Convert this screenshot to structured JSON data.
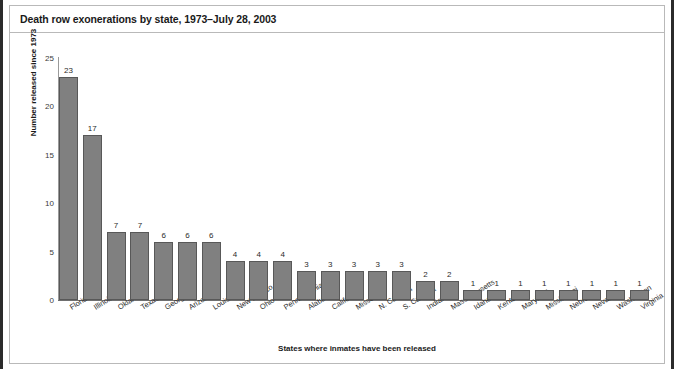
{
  "figure": {
    "title": "Death row exonerations by state, 1973–July 28, 2003",
    "bar_color": "#808080",
    "bar_edge_color": "#585858",
    "axis_color": "#6f6f6f",
    "background": "#ffffff"
  },
  "chart_data": {
    "type": "bar",
    "title": "Death row exonerations by state, 1973–July 28, 2003",
    "xlabel": "States where inmates have been released",
    "ylabel": "Number released since 1973",
    "ylim": [
      0,
      25
    ],
    "yticks": [
      0,
      5,
      10,
      15,
      20,
      25
    ],
    "ytick_labels": [
      "0",
      "5",
      "10",
      "15",
      "20",
      "25"
    ],
    "grid": false,
    "legend": null,
    "categories": [
      "Florida",
      "Illinois",
      "Oklahoma",
      "Texas",
      "Georgia",
      "Arizona",
      "Louisiana",
      "New Mexico",
      "Ohio",
      "Pennsylvania",
      "Alabama",
      "California",
      "Missouri",
      "N. Carolina",
      "S. Carolina",
      "Indiana",
      "Massachusetts",
      "Idaho",
      "Kentucky",
      "Maryland",
      "Mississippi",
      "Nebraska",
      "Nevada",
      "Washington",
      "Virginia"
    ],
    "values": [
      23,
      17,
      7,
      7,
      6,
      6,
      6,
      4,
      4,
      4,
      3,
      3,
      3,
      3,
      3,
      2,
      2,
      1,
      1,
      1,
      1,
      1,
      1,
      1,
      1
    ],
    "data_labels": [
      "23",
      "17",
      "7",
      "7",
      "6",
      "6",
      "6",
      "4",
      "4",
      "4",
      "3",
      "3",
      "3",
      "3",
      "3",
      "2",
      "2",
      "1",
      "1",
      "1",
      "1",
      "1",
      "1",
      "1",
      "1"
    ]
  }
}
